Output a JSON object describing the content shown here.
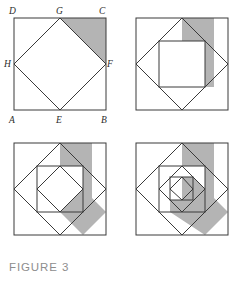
{
  "figure": {
    "caption": "FIGURE 3",
    "colors": {
      "background": "#ffffff",
      "stroke": "#3a3a3a",
      "shade": "#b4b4b4",
      "label": "#2b2b2b",
      "caption": "#8d8d8d"
    },
    "panels": [
      {
        "id": "panel-tl",
        "name": "panel-stage-1",
        "stage": 1,
        "labels": [
          {
            "text": "D",
            "x": 9,
            "y": 14
          },
          {
            "text": "G",
            "x": 56,
            "y": 14
          },
          {
            "text": "C",
            "x": 99,
            "y": 14
          },
          {
            "text": "H",
            "x": 5,
            "y": 65
          },
          {
            "text": "F",
            "x": 106,
            "y": 65
          },
          {
            "text": "A",
            "x": 9,
            "y": 125
          },
          {
            "text": "E",
            "x": 56,
            "y": 125
          },
          {
            "text": "B",
            "x": 102,
            "y": 125
          }
        ],
        "outer_square": {
          "x": 14,
          "y": 18,
          "size": 92
        },
        "inscribed_points": "G E H F",
        "shaded_region": "corner-triangle-top-right"
      },
      {
        "id": "panel-tr",
        "name": "panel-stage-2",
        "stage": 2,
        "labels": [],
        "outer_square": {
          "x": 14,
          "y": 18,
          "size": 92
        },
        "shaded_region": "stepped-region-right"
      },
      {
        "id": "panel-bl",
        "name": "panel-stage-3",
        "stage": 3,
        "labels": [],
        "outer_square": {
          "x": 14,
          "y": 14,
          "size": 92
        },
        "shaded_region": "stepped-region-right"
      },
      {
        "id": "panel-br",
        "name": "panel-stage-4",
        "stage": 4,
        "labels": [],
        "outer_square": {
          "x": 14,
          "y": 14,
          "size": 92
        },
        "shaded_region": "stepped-spiral-region"
      }
    ]
  }
}
